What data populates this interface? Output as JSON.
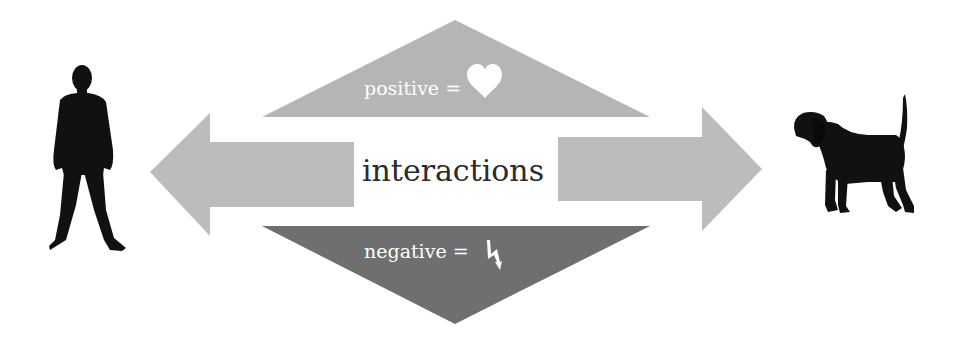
{
  "diagram": {
    "center_label": "interactions",
    "positive": {
      "label": "positive =",
      "icon": "heart-icon"
    },
    "negative": {
      "label": "negative =",
      "icon": "lightning-icon"
    },
    "left_actor": "person-silhouette",
    "right_actor": "dog-silhouette"
  },
  "colors": {
    "background": "#ffffff",
    "positive_triangle": "#b5b5b5",
    "negative_triangle": "#6f6f6f",
    "arrows": "#bcbcbc",
    "silhouettes": "#111111",
    "center_text": "#2b2b2b",
    "triangle_text": "#ffffff"
  }
}
